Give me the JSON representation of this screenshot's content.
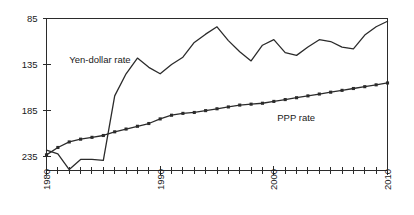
{
  "chart_data": {
    "type": "line",
    "title": "",
    "subtitle": "",
    "xlabel": "",
    "ylabel": "",
    "xlim": [
      1980,
      2010
    ],
    "ylim": [
      85,
      250
    ],
    "y_axis_inverted": true,
    "grid": false,
    "legend_position": "inline-annotations",
    "y_ticks": [
      85,
      135,
      185,
      235
    ],
    "y_tick_labels": [
      "85",
      "135",
      "185",
      "235"
    ],
    "x_ticks": [
      1980,
      1981,
      1982,
      1983,
      1984,
      1985,
      1986,
      1987,
      1988,
      1989,
      1990,
      1991,
      1992,
      1993,
      1994,
      1995,
      1996,
      1997,
      1998,
      1999,
      2000,
      2001,
      2002,
      2003,
      2004,
      2005,
      2006,
      2007,
      2008,
      2009,
      2010
    ],
    "x_tick_labels_shown": [
      "1980",
      "1990",
      "2000",
      "2010"
    ],
    "x_labeled_ticks": [
      1980,
      1990,
      2000,
      2010
    ],
    "x_tick_label_rotation": -90,
    "series": [
      {
        "name": "Yen-dollar rate",
        "label": "Yen-dollar rate",
        "label_x": 1982.0,
        "label_y": 133,
        "marker": "none",
        "color": "#2b2b2b",
        "x": [
          1980,
          1981,
          1982,
          1983,
          1984,
          1985,
          1986,
          1987,
          1988,
          1989,
          1990,
          1991,
          1992,
          1993,
          1994,
          1995,
          1996,
          1997,
          1998,
          1999,
          2000,
          2001,
          2002,
          2003,
          2004,
          2005,
          2006,
          2007,
          2008,
          2009,
          2010
        ],
        "values": [
          228,
          232,
          249,
          238,
          238,
          239,
          169,
          145,
          128,
          138,
          145,
          135,
          127,
          111,
          102,
          94,
          109,
          121,
          131,
          114,
          108,
          122,
          125,
          116,
          108,
          110,
          116,
          118,
          103,
          94,
          88
        ]
      },
      {
        "name": "PPP rate",
        "label": "PPP rate",
        "label_x": 2000.3,
        "label_y": 196,
        "marker": "square",
        "color": "#2b2b2b",
        "x": [
          1980,
          1981,
          1982,
          1983,
          1984,
          1985,
          1986,
          1987,
          1988,
          1989,
          1990,
          1991,
          1992,
          1993,
          1994,
          1995,
          1996,
          1997,
          1998,
          1999,
          2000,
          2001,
          2002,
          2003,
          2004,
          2005,
          2006,
          2007,
          2008,
          2009,
          2010
        ],
        "values": [
          233,
          225,
          219,
          216,
          214,
          212,
          208,
          205,
          202,
          199,
          194,
          190,
          188,
          187,
          185,
          183,
          181,
          179,
          178,
          177,
          175,
          173,
          171,
          169,
          167,
          165,
          163,
          161,
          159,
          157,
          155
        ]
      }
    ]
  }
}
